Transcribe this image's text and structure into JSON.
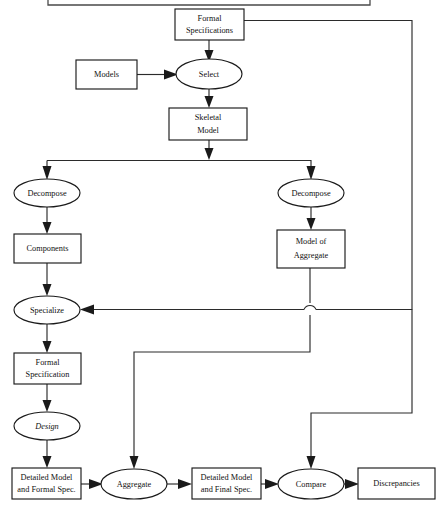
{
  "diagram": {
    "background_color": "#ffffff",
    "line_color": "#2b2b2b",
    "text_color": "#111111",
    "nodes": [
      {
        "id": "formal_specifications",
        "label_line1": "Formal",
        "label_line2": "Specifications",
        "shape": "rect",
        "x": 175,
        "y": 9,
        "w": 69,
        "h": 31
      },
      {
        "id": "models",
        "label_line1": "Models",
        "label_line2": "",
        "shape": "rect",
        "x": 76,
        "y": 60,
        "w": 61,
        "h": 29
      },
      {
        "id": "select",
        "label_line1": "Select",
        "label_line2": "",
        "shape": "ellipse",
        "cx": 209,
        "cy": 74,
        "rx": 33,
        "ry": 15
      },
      {
        "id": "skeletal_model",
        "label_line1": "Skeletal",
        "label_line2": "Model",
        "shape": "rect",
        "x": 169,
        "y": 108,
        "w": 78,
        "h": 32
      },
      {
        "id": "decompose_left",
        "label_line1": "Decompose",
        "label_line2": "",
        "shape": "ellipse",
        "cx": 47,
        "cy": 193,
        "rx": 33,
        "ry": 14
      },
      {
        "id": "decompose_right",
        "label_line1": "Decompose",
        "label_line2": "",
        "shape": "ellipse",
        "cx": 311,
        "cy": 193,
        "rx": 33,
        "ry": 14
      },
      {
        "id": "components",
        "label_line1": "Components",
        "label_line2": "",
        "shape": "rect",
        "x": 14,
        "y": 234,
        "w": 67,
        "h": 29
      },
      {
        "id": "model_of_aggregate",
        "label_line1": "Model of",
        "label_line2": "Aggregate",
        "shape": "rect",
        "x": 277,
        "y": 230,
        "w": 68,
        "h": 38
      },
      {
        "id": "specialize",
        "label_line1": "Specialize",
        "label_line2": "",
        "shape": "ellipse",
        "cx": 47,
        "cy": 310,
        "rx": 33,
        "ry": 14
      },
      {
        "id": "formal_specification",
        "label_line1": "Formal",
        "label_line2": "Specification",
        "shape": "rect",
        "x": 14,
        "y": 353,
        "w": 67,
        "h": 31
      },
      {
        "id": "design",
        "label_line1": "Design",
        "label_line2": "",
        "shape": "ellipse",
        "cx": 47,
        "cy": 426,
        "rx": 33,
        "ry": 14,
        "italic": true
      },
      {
        "id": "detailed_model_formal",
        "label_line1": "Detailed Model",
        "label_line2": "and Formal Spec.",
        "shape": "rect",
        "x": 12,
        "y": 468,
        "w": 69,
        "h": 31
      },
      {
        "id": "aggregate",
        "label_line1": "Aggregate",
        "label_line2": "",
        "shape": "ellipse",
        "cx": 134,
        "cy": 484,
        "rx": 33,
        "ry": 15
      },
      {
        "id": "detailed_model_final",
        "label_line1": "Detailed Model",
        "label_line2": "and Final Spec.",
        "shape": "rect",
        "x": 192,
        "y": 468,
        "w": 69,
        "h": 31
      },
      {
        "id": "compare",
        "label_line1": "Compare",
        "label_line2": "",
        "shape": "ellipse",
        "cx": 311,
        "cy": 484,
        "rx": 33,
        "ry": 15
      },
      {
        "id": "discrepancies",
        "label_line1": "Discrepancies",
        "label_line2": "",
        "shape": "rect",
        "x": 358,
        "y": 468,
        "w": 77,
        "h": 31
      }
    ],
    "edges": [
      {
        "id": "formal_specs-to-select",
        "from": "formal_specifications",
        "to": "select"
      },
      {
        "id": "models-to-select",
        "from": "models",
        "to": "select"
      },
      {
        "id": "select-to-skeletal_model",
        "from": "select",
        "to": "skeletal_model"
      },
      {
        "id": "skeletal_model-to-decompose_left",
        "from": "skeletal_model",
        "to": "decompose_left"
      },
      {
        "id": "skeletal_model-to-decompose_right",
        "from": "skeletal_model",
        "to": "decompose_right"
      },
      {
        "id": "decompose_left-to-components",
        "from": "decompose_left",
        "to": "components"
      },
      {
        "id": "decompose_right-to-model_of_aggregate",
        "from": "decompose_right",
        "to": "model_of_aggregate"
      },
      {
        "id": "components-to-specialize",
        "from": "components",
        "to": "specialize"
      },
      {
        "id": "formal_specs-feedback-to-specialize",
        "from": "formal_specifications",
        "to": "specialize"
      },
      {
        "id": "specialize-to-formal_specification",
        "from": "specialize",
        "to": "formal_specification"
      },
      {
        "id": "formal_specification-to-design",
        "from": "formal_specification",
        "to": "design"
      },
      {
        "id": "design-to-detailed_model_formal",
        "from": "design",
        "to": "detailed_model_formal"
      },
      {
        "id": "model_of_aggregate-to-aggregate",
        "from": "model_of_aggregate",
        "to": "aggregate"
      },
      {
        "id": "detailed_model_formal-to-aggregate",
        "from": "detailed_model_formal",
        "to": "aggregate"
      },
      {
        "id": "aggregate-to-detailed_model_final",
        "from": "aggregate",
        "to": "detailed_model_final"
      },
      {
        "id": "detailed_model_final-to-compare",
        "from": "detailed_model_final",
        "to": "compare"
      },
      {
        "id": "formal_specs-feedback-to-compare",
        "from": "formal_specifications",
        "to": "compare"
      },
      {
        "id": "compare-to-discrepancies",
        "from": "compare",
        "to": "discrepancies"
      }
    ],
    "line_hops": [
      {
        "id": "hop-aggregate-feedback-crossing",
        "x": 310,
        "y": 309
      }
    ],
    "cut_off_box": {
      "id": "truncated-box-above",
      "x": 48,
      "y": 0,
      "w": 322,
      "h": 5
    }
  }
}
